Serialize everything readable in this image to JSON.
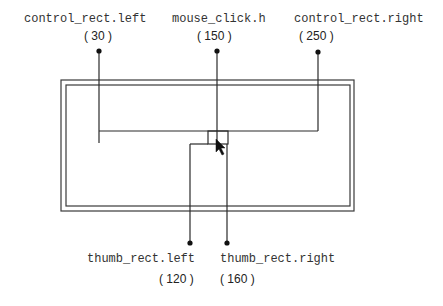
{
  "diagram": {
    "top_labels": [
      {
        "name": "control_rect.left",
        "value": "( 30 )"
      },
      {
        "name": "mouse_click.h",
        "value": "( 150 )"
      },
      {
        "name": "control_rect.right",
        "value": "( 250 )"
      }
    ],
    "bottom_labels": [
      {
        "name": "thumb_rect.left",
        "value": "( 120 )"
      },
      {
        "name": "thumb_rect.right",
        "value": "( 160 )"
      }
    ],
    "colors": {
      "line": "#2a2a2a",
      "text": "#333333",
      "background": "#ffffff"
    }
  }
}
